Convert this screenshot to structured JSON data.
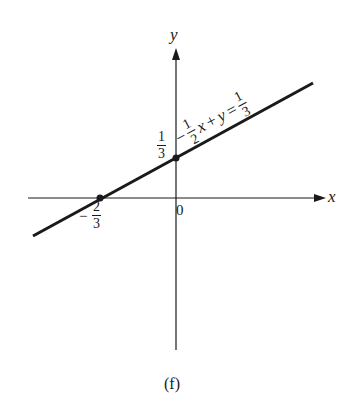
{
  "figure": {
    "caption": "(f)",
    "equation": {
      "coef_sign": "−",
      "coef_num": "1",
      "coef_den": "2",
      "var_x": "x",
      "plus": "+",
      "var_y": "y",
      "equals": "=",
      "rhs_num": "1",
      "rhs_den": "3"
    },
    "axes": {
      "x_label": "x",
      "y_label": "y",
      "origin_label": "0"
    },
    "points": {
      "y_intercept": {
        "num": "1",
        "den": "3"
      },
      "x_intercept": {
        "sign": "−",
        "num": "2",
        "den": "3"
      }
    },
    "colors": {
      "ink": "#1a1a1a",
      "background": "#ffffff"
    }
  }
}
